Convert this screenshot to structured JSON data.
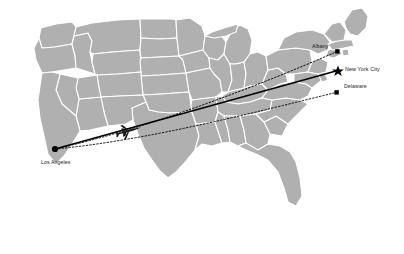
{
  "map": {
    "title": "United States flight routes map",
    "region": "Continental United States",
    "colors": {
      "land": "#b0b0b0",
      "border": "#ffffff",
      "background": "#ffffff",
      "route": "#000000",
      "marker": "#000000",
      "label": "#1a1a1a"
    },
    "origin": {
      "name": "Los Angeles",
      "marker": "circle-marker",
      "x": 55,
      "y": 149
    },
    "destinations": [
      {
        "name": "Albany",
        "marker": "square-marker",
        "route_style": "dotted",
        "x": 338,
        "y": 52,
        "label_anchor": "left"
      },
      {
        "name": "New York City",
        "marker": "star-marker",
        "route_style": "solid",
        "x": 338,
        "y": 72,
        "label_anchor": "right"
      },
      {
        "name": "Delaware",
        "marker": "square-marker",
        "route_style": "dotted",
        "x": 337,
        "y": 93,
        "label_anchor": "right"
      }
    ],
    "aircraft": {
      "name": "airplane-icon",
      "x": 128,
      "y": 131,
      "heading_degrees": 18
    }
  }
}
